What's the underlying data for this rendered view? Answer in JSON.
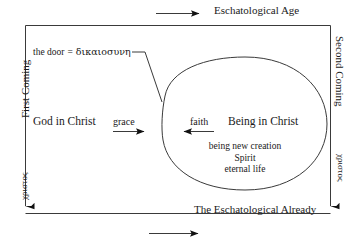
{
  "diagram": {
    "background_color": "#ffffff",
    "line_color": "#3a3a3a",
    "text_color": "#1a1a1a",
    "top_caption": "Eschatological Age",
    "bottom_caption": "The Eschatological Already",
    "left_axis": {
      "caption": "First Coming",
      "greek": "χριστος"
    },
    "right_axis": {
      "caption": "Second Coming",
      "greek": "χριστος"
    },
    "door": {
      "label": "the door",
      "equals": "=",
      "greek": "δικαιοσυνη"
    },
    "left_pole": "God in Christ",
    "right_pole": "Being in Christ",
    "arrow_left_label": "grace",
    "arrow_right_label": "faith",
    "attributes": [
      "being new creation",
      "Spirit",
      "eternal life"
    ]
  }
}
